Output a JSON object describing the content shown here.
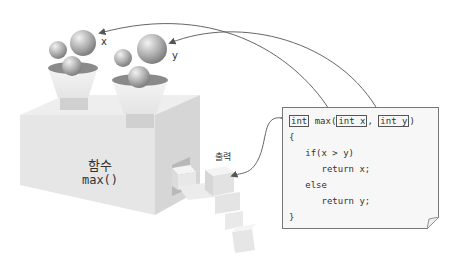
{
  "diagram": {
    "inputs": [
      {
        "label": "x"
      },
      {
        "label": "y"
      }
    ],
    "function_box": {
      "title": "함수",
      "name": "max()"
    },
    "output_label": "출력",
    "code": {
      "signature": {
        "return_type": "int",
        "name": "max(",
        "param1": "int x",
        "sep": ", ",
        "param2": "int y",
        "close": ")"
      },
      "lines": [
        "{",
        "   if(x > y)",
        "      return x;",
        "   else",
        "      return y;",
        "}"
      ]
    },
    "colors": {
      "box_face": "#e6e6e6",
      "box_top": "#eeeeee",
      "box_side": "#d4d4d4",
      "sphere": "#9a9a9a",
      "arrow": "#555555",
      "code_bg": "#f7f7f7",
      "code_border": "#777777"
    }
  }
}
